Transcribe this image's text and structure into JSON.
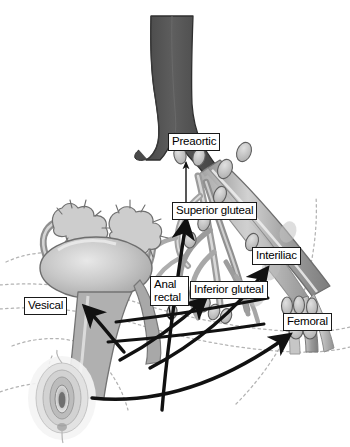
{
  "figure": {
    "width": 350,
    "height": 447,
    "background": "#ffffff"
  },
  "labels": [
    {
      "id": "preaortic",
      "text": "Preaortic",
      "x": 168,
      "y": 133
    },
    {
      "id": "superior-gluteal",
      "text": "Superior gluteal",
      "x": 172,
      "y": 202
    },
    {
      "id": "interiliac",
      "text": "Interiliac",
      "x": 252,
      "y": 247
    },
    {
      "id": "anal-rectal-1",
      "text": "Anal",
      "x": 150,
      "y": 276
    },
    {
      "id": "anal-rectal-2",
      "text": "rectal",
      "x": 150,
      "y": 290
    },
    {
      "id": "inferior-gluteal",
      "text": "Inferior gluteal",
      "x": 190,
      "y": 281
    },
    {
      "id": "femoral",
      "text": "Femoral",
      "x": 283,
      "y": 313
    },
    {
      "id": "vesical",
      "text": "Vesical",
      "x": 24,
      "y": 297
    }
  ],
  "anatomy": {
    "aorta": "abdominal aorta",
    "iliac_vessels": "common, internal and external iliac vessels",
    "organs": [
      "uterus",
      "bladder",
      "fallopian tubes",
      "ovaries",
      "vagina",
      "vulva",
      "rectum"
    ],
    "lymph_node_groups": [
      "Preaortic",
      "Superior gluteal",
      "Interiliac",
      "Inferior gluteal",
      "Anal rectal",
      "Femoral",
      "Vesical"
    ]
  },
  "colors": {
    "aorta_dark": "#555555",
    "vessel_mid": "#8c8c8c",
    "vessel_light": "#c9c9c9",
    "organ_fill": "#b3b3b3",
    "organ_light": "#d8d8d8",
    "node_fill": "#c2c2c2",
    "outline": "#4d4d4d",
    "arrow": "#111111",
    "dotted_body": "#b0b0b0",
    "label_border": "#1a1a1a",
    "label_bg": "#ffffff",
    "label_text": "#000000"
  }
}
